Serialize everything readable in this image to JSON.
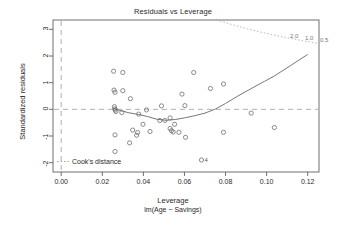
{
  "chart_data": {
    "type": "scatter",
    "title": "Residuals vs Leverage",
    "xlabel": "Leverage",
    "xsublabel": "lm(Age ~ Savings)",
    "ylabel": "Standardized residuals",
    "xlim": [
      -0.004,
      0.1255
    ],
    "ylim": [
      -2.35,
      3.35
    ],
    "xticks": [
      0.0,
      0.02,
      0.04,
      0.06,
      0.08,
      0.1,
      0.12
    ],
    "xtick_labels": [
      "0.00",
      "0.02",
      "0.04",
      "0.06",
      "0.08",
      "0.10",
      "0.12"
    ],
    "yticks": [
      -2,
      -1,
      0,
      1,
      2,
      3
    ],
    "ytick_labels": [
      "-2",
      "-1",
      "0",
      "1",
      "2",
      "3"
    ],
    "grid": false,
    "reference_lines": [
      {
        "orientation": "horizontal",
        "value": 0,
        "style": "dashed",
        "color": "#9a9a9a"
      },
      {
        "orientation": "vertical",
        "value": 0,
        "style": "dashed",
        "color": "#9a9a9a"
      }
    ],
    "legend": {
      "position": "bottom-left",
      "entries": [
        {
          "label": "Cook's distance",
          "style": "dotted",
          "color": "#9a9a9a"
        }
      ]
    },
    "cook_contour_labels": [
      "2.0",
      "1.0",
      "0.5"
    ],
    "points": [
      {
        "x": 0.0255,
        "y": 1.43
      },
      {
        "x": 0.03,
        "y": 1.38
      },
      {
        "x": 0.0257,
        "y": 0.72
      },
      {
        "x": 0.0262,
        "y": 0.64
      },
      {
        "x": 0.03,
        "y": 0.7
      },
      {
        "x": 0.0337,
        "y": 0.4
      },
      {
        "x": 0.0259,
        "y": 0.1
      },
      {
        "x": 0.0261,
        "y": 0.02
      },
      {
        "x": 0.0263,
        "y": -0.03
      },
      {
        "x": 0.0266,
        "y": -0.08
      },
      {
        "x": 0.0295,
        "y": -0.12
      },
      {
        "x": 0.0377,
        "y": -0.18
      },
      {
        "x": 0.0415,
        "y": -0.02
      },
      {
        "x": 0.048,
        "y": -0.42
      },
      {
        "x": 0.0505,
        "y": -0.42
      },
      {
        "x": 0.053,
        "y": -0.32
      },
      {
        "x": 0.0488,
        "y": 0.13
      },
      {
        "x": 0.0398,
        "y": -0.56
      },
      {
        "x": 0.0348,
        "y": -0.78
      },
      {
        "x": 0.0367,
        "y": -0.97
      },
      {
        "x": 0.0262,
        "y": -0.96
      },
      {
        "x": 0.0262,
        "y": -1.58
      },
      {
        "x": 0.0333,
        "y": -1.26
      },
      {
        "x": 0.0372,
        "y": -0.87
      },
      {
        "x": 0.0432,
        "y": -0.83
      },
      {
        "x": 0.053,
        "y": -0.72
      },
      {
        "x": 0.0537,
        "y": -0.8
      },
      {
        "x": 0.0545,
        "y": -0.85
      },
      {
        "x": 0.0552,
        "y": -0.56
      },
      {
        "x": 0.0573,
        "y": -0.86
      },
      {
        "x": 0.0605,
        "y": -1.05
      },
      {
        "x": 0.0602,
        "y": 0.14
      },
      {
        "x": 0.0588,
        "y": 0.57
      },
      {
        "x": 0.0645,
        "y": 1.38
      },
      {
        "x": 0.0727,
        "y": 0.78
      },
      {
        "x": 0.079,
        "y": 0.95
      },
      {
        "x": 0.079,
        "y": -0.86
      },
      {
        "x": 0.0925,
        "y": -0.14
      },
      {
        "x": 0.1038,
        "y": -0.68
      },
      {
        "x": 0.0683,
        "y": -1.9,
        "label": "4"
      }
    ],
    "smoother": {
      "type": "lowess",
      "x": [
        0.0259,
        0.029,
        0.033,
        0.0375,
        0.042,
        0.0465,
        0.051,
        0.0555,
        0.06,
        0.065,
        0.07,
        0.075,
        0.08,
        0.086,
        0.092,
        0.099,
        0.104,
        0.112,
        0.12
      ],
      "y": [
        0.03,
        -0.05,
        -0.13,
        -0.19,
        -0.27,
        -0.37,
        -0.41,
        -0.38,
        -0.32,
        -0.24,
        -0.14,
        0.01,
        0.22,
        0.5,
        0.76,
        1.05,
        1.26,
        1.66,
        2.06
      ]
    }
  }
}
